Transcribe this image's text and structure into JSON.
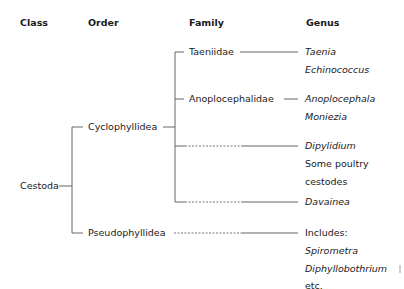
{
  "headers": {
    "class": "Class",
    "order": "Order",
    "family": "Family",
    "genus": "Genus"
  },
  "class": {
    "name": "Cestoda"
  },
  "orders": [
    {
      "name": "Cyclophyllidea"
    },
    {
      "name": "Pseudophyllidea"
    }
  ],
  "families": [
    {
      "name": "Taeniidae"
    },
    {
      "name": "Anoplocephalidae"
    }
  ],
  "genera": {
    "taeniidae": [
      "Taenia",
      "Echinococcus"
    ],
    "anoplocephalidae": [
      "Anoplocephala",
      "Moniezia"
    ],
    "dipylidium": {
      "genus": "Dipylidium",
      "note_line1": "Some poultry",
      "note_line2": "cestodes"
    },
    "davainea": "Davainea",
    "pseudophyllidea": {
      "prefix": "Includes:",
      "items": [
        "Spirometra",
        "Diphyllobothrium"
      ],
      "suffix": "etc."
    }
  },
  "colors": {
    "line": "#555555",
    "text": "#1a1a1a",
    "background": "#ffffff"
  }
}
